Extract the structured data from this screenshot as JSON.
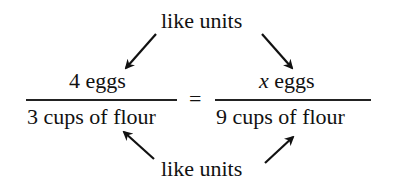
{
  "diagram": {
    "top_label": "like units",
    "bottom_label": "like units",
    "left_fraction": {
      "numerator": "4 eggs",
      "denominator": "3 cups of flour"
    },
    "equals": "=",
    "right_fraction": {
      "variable": "x",
      "numerator_rest": " eggs",
      "denominator": "9 cups of flour"
    }
  }
}
